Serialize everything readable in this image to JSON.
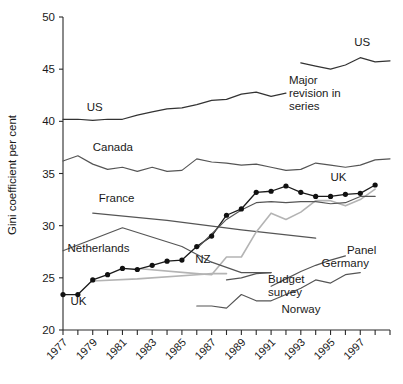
{
  "chart_data": {
    "type": "line",
    "title": "",
    "xlabel": "",
    "ylabel": "Gini coefficient per cent",
    "xlim": [
      1977,
      1999
    ],
    "ylim": [
      20,
      50
    ],
    "ytick_values": [
      20,
      25,
      30,
      35,
      40,
      45,
      50
    ],
    "ytick_labels": [
      "20",
      "25",
      "30",
      "35",
      "40",
      "45",
      "50"
    ],
    "xtick_values": [
      1977,
      1978,
      1979,
      1980,
      1981,
      1982,
      1983,
      1984,
      1985,
      1986,
      1987,
      1988,
      1989,
      1990,
      1991,
      1992,
      1993,
      1994,
      1995,
      1996,
      1997,
      1998,
      1999
    ],
    "xtick_labels": [
      "1977",
      "1979",
      "1981",
      "1983",
      "1985",
      "1987",
      "1989",
      "1991",
      "1993",
      "1995",
      "1997"
    ],
    "xtick_labelled_values": [
      1977,
      1979,
      1981,
      1983,
      1985,
      1987,
      1989,
      1991,
      1993,
      1995,
      1997
    ],
    "grid": false,
    "legend": "inline-labels",
    "annotations": [
      {
        "name": "major-revision-note",
        "text": "Major revision in series",
        "x": 1992.2,
        "y": 43.6
      }
    ],
    "series": [
      {
        "name": "US",
        "style": "dark",
        "markers": false,
        "label": "US",
        "label_x": 1978.6,
        "label_y": 41.0,
        "x": [
          1977,
          1978,
          1979,
          1980,
          1981,
          1982,
          1983,
          1984,
          1985,
          1986,
          1987,
          1988,
          1989,
          1990,
          1991,
          1992
        ],
        "y": [
          40.2,
          40.2,
          40.1,
          40.2,
          40.2,
          40.6,
          40.9,
          41.2,
          41.3,
          41.6,
          42.0,
          42.1,
          42.6,
          42.8,
          42.4,
          42.7
        ]
      },
      {
        "name": "US (revised)",
        "style": "dark",
        "markers": false,
        "label": "US",
        "label_x": 1996.6,
        "label_y": 47.2,
        "x": [
          1993,
          1994,
          1995,
          1996,
          1997,
          1998,
          1999
        ],
        "y": [
          45.6,
          45.3,
          45.0,
          45.4,
          46.1,
          45.7,
          45.8
        ]
      },
      {
        "name": "Canada",
        "style": "mid",
        "markers": false,
        "label": "Canada",
        "label_x": 1979.0,
        "label_y": 37.2,
        "x": [
          1977,
          1978,
          1979,
          1980,
          1981,
          1982,
          1983,
          1984,
          1985,
          1986,
          1987,
          1988,
          1989,
          1990,
          1991,
          1992,
          1993,
          1994,
          1995,
          1996,
          1997,
          1998,
          1999
        ],
        "y": [
          36.2,
          36.7,
          35.9,
          35.4,
          35.6,
          35.2,
          35.6,
          35.2,
          35.3,
          36.4,
          36.1,
          36.0,
          35.8,
          35.9,
          35.6,
          35.3,
          35.4,
          36.0,
          35.8,
          35.6,
          35.8,
          36.3,
          36.4
        ]
      },
      {
        "name": "France",
        "style": "mid",
        "markers": false,
        "label": "France",
        "label_x": 1979.4,
        "label_y": 32.3,
        "x": [
          1979,
          1984,
          1989,
          1994
        ],
        "y": [
          31.2,
          30.5,
          29.6,
          28.8
        ]
      },
      {
        "name": "Netherlands",
        "style": "mid",
        "markers": false,
        "label": "Netherlands",
        "label_x": 1977.3,
        "label_y": 27.5,
        "x": [
          1977,
          1981,
          1985,
          1987
        ],
        "y": [
          27.6,
          29.8,
          28.0,
          26.5
        ]
      },
      {
        "name": "NZ",
        "style": "light",
        "markers": false,
        "label": "NZ",
        "label_x": 1985.9,
        "label_y": 26.4,
        "x": [
          1982,
          1986,
          1987,
          1988,
          1989,
          1990,
          1991,
          1992,
          1993,
          1994,
          1995,
          1996,
          1997,
          1998
        ],
        "y": [
          25.9,
          25.4,
          25.3,
          27.0,
          27.0,
          29.4,
          31.2,
          30.6,
          31.3,
          32.4,
          32.4,
          31.9,
          32.5,
          33.5
        ]
      },
      {
        "name": "UK",
        "style": "uk",
        "markers": true,
        "label": "UK",
        "label_x": 1977.5,
        "label_y": 22.4,
        "label2": "UK",
        "label2_x": 1995.0,
        "label2_y": 34.3,
        "x": [
          1977,
          1978,
          1979,
          1980,
          1981,
          1982,
          1983,
          1984,
          1985,
          1986,
          1987,
          1988,
          1989,
          1990,
          1991,
          1992,
          1993,
          1994,
          1995,
          1996,
          1997,
          1998
        ],
        "y": [
          23.4,
          23.4,
          24.8,
          25.3,
          25.9,
          25.8,
          26.2,
          26.6,
          26.7,
          28.0,
          29.0,
          31.0,
          31.6,
          33.2,
          33.3,
          33.8,
          33.2,
          32.8,
          32.8,
          33.0,
          33.1,
          33.9
        ]
      },
      {
        "name": "UK secondary",
        "style": "mid",
        "markers": false,
        "label": "",
        "x": [
          1986,
          1987,
          1988,
          1989,
          1990,
          1991,
          1992,
          1993,
          1994,
          1995,
          1996,
          1997,
          1998
        ],
        "y": [
          27.8,
          29.2,
          30.6,
          31.5,
          32.2,
          32.3,
          32.2,
          32.3,
          32.3,
          32.1,
          32.2,
          32.8,
          32.8
        ]
      },
      {
        "name": "Germany (Panel)",
        "style": "mid",
        "markers": false,
        "label": "Panel",
        "label_x": 1996.1,
        "label_y": 27.3,
        "x": [
          1991,
          1992,
          1993,
          1994,
          1995,
          1996
        ],
        "y": [
          24.2,
          24.9,
          25.6,
          26.2,
          26.7,
          27.1
        ]
      },
      {
        "name": "Germany (Budget survey)",
        "style": "mid",
        "markers": false,
        "label": "Germany",
        "label_x": 1994.4,
        "label_y": 26.0,
        "label_budget": "Budget survey",
        "label_budget_x": 1990.8,
        "label_budget_y": 24.5,
        "x": [
          1988,
          1989,
          1990,
          1991
        ],
        "y": [
          24.8,
          25.0,
          25.4,
          25.5
        ]
      },
      {
        "name": "Norway",
        "style": "mid",
        "markers": false,
        "label": "Norway",
        "label_x": 1991.7,
        "label_y": 21.6,
        "x": [
          1986,
          1987,
          1988,
          1989,
          1990,
          1991,
          1992,
          1993,
          1994,
          1995,
          1996,
          1997
        ],
        "y": [
          22.3,
          22.3,
          22.1,
          23.4,
          22.8,
          22.8,
          23.4,
          24.0,
          24.8,
          24.5,
          25.3,
          25.5
        ]
      },
      {
        "name": "Netherlands continuation",
        "style": "mid",
        "markers": false,
        "label": "",
        "x": [
          1987,
          1989,
          1991
        ],
        "y": [
          26.5,
          25.5,
          25.5
        ]
      },
      {
        "name": "Budget survey low",
        "style": "light",
        "markers": false,
        "label": "",
        "x": [
          1979,
          1982,
          1986,
          1987,
          1988
        ],
        "y": [
          24.7,
          24.9,
          25.3,
          25.4,
          25.4
        ]
      }
    ]
  },
  "colors": {
    "background": "#ffffff",
    "axis": "#2a2a2a",
    "dark_series": "#333333",
    "mid_series": "#555555",
    "light_series": "#b4b4b4",
    "marker": "#111111"
  }
}
